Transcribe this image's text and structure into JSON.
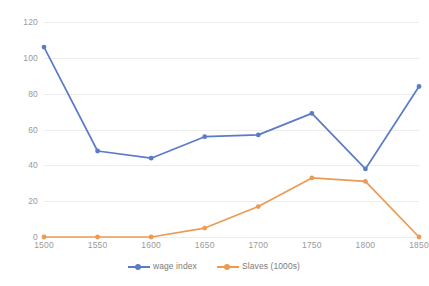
{
  "chart_data": {
    "type": "line",
    "title": "",
    "xlabel": "",
    "ylabel": "",
    "categories": [
      1500,
      1550,
      1600,
      1650,
      1700,
      1750,
      1800,
      1850
    ],
    "x_tick_labels": [
      "1500",
      "1550",
      "1600",
      "1650",
      "1700",
      "1750",
      "1800",
      "1850"
    ],
    "y_tick_labels": [
      "0",
      "20",
      "40",
      "60",
      "80",
      "100",
      "120"
    ],
    "y_ticks": [
      0,
      20,
      40,
      60,
      80,
      100,
      120
    ],
    "ylim": [
      0,
      120
    ],
    "xlim": [
      1500,
      1850
    ],
    "grid": true,
    "legend_position": "bottom",
    "markers": true,
    "series": [
      {
        "name": "wage index",
        "color": "#5b7bc8",
        "values": [
          106,
          48,
          44,
          56,
          57,
          69,
          38,
          84
        ]
      },
      {
        "name": "Slaves (1000s)",
        "color": "#ed9a53",
        "values": [
          0,
          0,
          0,
          5,
          17,
          33,
          31,
          0
        ]
      }
    ]
  },
  "colors": {
    "wage_index": "#5b7bc8",
    "slaves": "#ed9a53",
    "gridline": "#ededed",
    "tick_text": "#9a9a9a",
    "legend_text": "#7b7b7b",
    "background": "#ffffff"
  }
}
